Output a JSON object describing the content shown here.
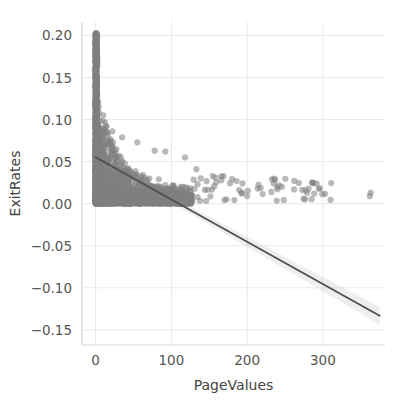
{
  "chart_data": {
    "type": "scatter",
    "title": "",
    "subtitle": "",
    "xlabel": "PageValues",
    "ylabel": "ExitRates",
    "xlim": [
      -18,
      382
    ],
    "ylim": [
      -0.168,
      0.216
    ],
    "xticks": [
      0,
      100,
      200,
      300
    ],
    "xticklabels": [
      "0",
      "100",
      "200",
      "300"
    ],
    "yticks": [
      0.2,
      0.15,
      0.1,
      0.05,
      0.0,
      -0.05,
      -0.1,
      -0.15
    ],
    "yticklabels": [
      "0.20",
      "0.15",
      "0.10",
      "0.05",
      "0.00",
      "−0.05",
      "−0.10",
      "−0.15"
    ],
    "grid": true,
    "legend": null,
    "legend_position": "none",
    "marker": {
      "shape": "circle",
      "radius_px": 3.1,
      "color": "#7f7f7f",
      "opacity": 0.55,
      "edge_color": "none"
    },
    "regression": {
      "type": "linear-fit",
      "line_color": "#4d4d4d",
      "line_width_px": 1.7,
      "band_color": "#c8c8c8",
      "band_opacity": 0.3,
      "intercept": 0.0553,
      "slope": -0.000503,
      "x_start": 0,
      "x_end": 375,
      "y_start": 0.0553,
      "y_end": -0.1333,
      "band_halfwidth_start": 0.0022,
      "band_halfwidth_end": 0.0105
    },
    "annotations": [],
    "clusters": [
      {
        "name": "zero-spike",
        "description": "dense vertical column of points at PageValues near 0 spanning ExitRates 0.00 to 0.20",
        "x_center": 0.6,
        "y_range": [
          0.0,
          0.203
        ],
        "approx_count": 900
      },
      {
        "name": "low-value-mass",
        "description": "dense wedge decaying from ExitRates 0.10 at PageValues 0 toward 0.01 near PageValues 120",
        "x_range": [
          0,
          125
        ],
        "y_range": [
          0.0,
          0.1
        ],
        "approx_count": 1600
      },
      {
        "name": "right-tail",
        "description": "sparse points near ExitRates 0.005 to 0.03 for PageValues 130 to 375",
        "x_range": [
          128,
          375
        ],
        "y_range": [
          0.003,
          0.033
        ],
        "approx_count": 60
      }
    ],
    "notable_points": [
      {
        "x": 1,
        "y": 0.203
      },
      {
        "x": 14,
        "y": 0.092
      },
      {
        "x": 22,
        "y": 0.086
      },
      {
        "x": 35,
        "y": 0.079
      },
      {
        "x": 55,
        "y": 0.073
      },
      {
        "x": 78,
        "y": 0.063
      },
      {
        "x": 92,
        "y": 0.062
      },
      {
        "x": 118,
        "y": 0.055
      },
      {
        "x": 133,
        "y": 0.041
      },
      {
        "x": 158,
        "y": 0.031
      },
      {
        "x": 186,
        "y": 0.027
      },
      {
        "x": 214,
        "y": 0.018
      },
      {
        "x": 232,
        "y": 0.014
      },
      {
        "x": 246,
        "y": 0.02
      },
      {
        "x": 262,
        "y": 0.017
      },
      {
        "x": 277,
        "y": 0.016
      },
      {
        "x": 296,
        "y": 0.018
      },
      {
        "x": 362,
        "y": 0.009
      },
      {
        "x": 363,
        "y": 0.013
      }
    ],
    "style": {
      "background": "#ffffff",
      "grid_color": "#e9e9e9",
      "axis_spine_color": "#d8d8d8",
      "tick_label_color": "#555555",
      "axis_title_color": "#444444"
    }
  }
}
